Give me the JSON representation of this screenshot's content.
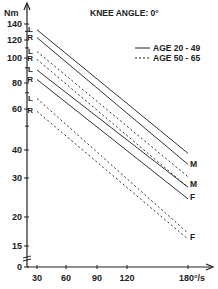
{
  "chart_data": {
    "type": "line",
    "title": "KNEE ANGLE: 0°",
    "ylabel": "Nm",
    "xlabel": "°/s",
    "yscale": "log",
    "ylim": [
      0,
      150
    ],
    "xlim": [
      30,
      180
    ],
    "y_ticks": [
      0,
      15,
      20,
      30,
      40,
      60,
      80,
      100,
      120,
      140
    ],
    "x_ticks": [
      30,
      60,
      90,
      120,
      180
    ],
    "x_tick_labels": [
      "30",
      "60",
      "90",
      "120",
      "180°/s"
    ],
    "grid": false,
    "legend": {
      "position": "upper right",
      "entries": [
        {
          "style": "solid",
          "label": "AGE 20 - 49"
        },
        {
          "style": "dashed",
          "label": "AGE 50 - 65"
        }
      ]
    },
    "series": [
      {
        "name": "M 20-49 L",
        "style": "solid",
        "side": "L",
        "sex": "M",
        "x": [
          30,
          180
        ],
        "values": [
          132,
          38
        ]
      },
      {
        "name": "M 20-49 R",
        "style": "solid",
        "side": "R",
        "sex": "M",
        "x": [
          30,
          180
        ],
        "values": [
          122,
          34
        ]
      },
      {
        "name": "M 50-65 L",
        "style": "dashed",
        "side": "L",
        "sex": "M",
        "x": [
          30,
          180
        ],
        "values": [
          106,
          30
        ]
      },
      {
        "name": "M 50-65 R",
        "style": "dashed",
        "side": "R",
        "sex": "M",
        "x": [
          30,
          180
        ],
        "values": [
          98,
          27
        ]
      },
      {
        "name": "F 20-49 L",
        "style": "solid",
        "side": "L",
        "sex": "F",
        "x": [
          30,
          180
        ],
        "values": [
          88,
          27
        ]
      },
      {
        "name": "F 20-49 R",
        "style": "solid",
        "side": "R",
        "sex": "F",
        "x": [
          30,
          180
        ],
        "values": [
          80,
          24
        ]
      },
      {
        "name": "F 50-65 L",
        "style": "dashed",
        "side": "L",
        "sex": "F",
        "x": [
          30,
          180
        ],
        "values": [
          66,
          17
        ]
      },
      {
        "name": "F 50-65 R",
        "style": "dashed",
        "side": "R",
        "sex": "F",
        "x": [
          30,
          180
        ],
        "values": [
          58,
          16
        ]
      }
    ],
    "annotations": [
      "L",
      "R",
      "L",
      "R",
      "L",
      "R",
      "L",
      "R",
      "M",
      "M",
      "F",
      "F"
    ]
  },
  "labels": {
    "title": "KNEE ANGLE: 0°",
    "y_unit": "Nm",
    "legend_solid": "AGE 20 - 49",
    "legend_dashed": "AGE 50 - 65",
    "end_labels": [
      "M",
      "M",
      "F",
      "F"
    ]
  }
}
